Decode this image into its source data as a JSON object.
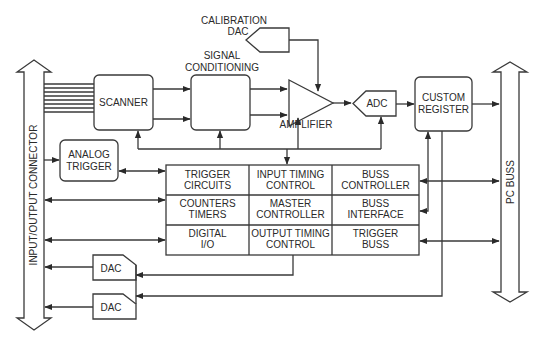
{
  "diagram": {
    "type": "block-diagram",
    "connectors": {
      "left": "INPUT/OUTPUT CONNECTOR",
      "right": "PC BUSS"
    },
    "blocks": {
      "calibration_dac": [
        "CALIBRATION",
        "DAC"
      ],
      "signal_conditioning_title": [
        "SIGNAL",
        "CONDITIONING"
      ],
      "scanner": "SCANNER",
      "amplifier": "AMPLIFIER",
      "adc": "ADC",
      "custom_register": [
        "CUSTOM",
        "REGISTER"
      ],
      "analog_trigger": [
        "ANALOG",
        "TRIGGER"
      ],
      "dac1": "DAC",
      "dac2": "DAC"
    },
    "grid": [
      [
        [
          "TRIGGER",
          "CIRCUITS"
        ],
        [
          "INPUT TIMING",
          "CONTROL"
        ],
        [
          "BUSS",
          "CONTROLLER"
        ]
      ],
      [
        [
          "COUNTERS",
          "TIMERS"
        ],
        [
          "MASTER",
          "CONTROLLER"
        ],
        [
          "BUSS",
          "INTERFACE"
        ]
      ],
      [
        [
          "DIGITAL",
          "I/O"
        ],
        [
          "OUTPUT TIMING",
          "CONTROL"
        ],
        [
          "TRIGGER",
          "BUSS"
        ]
      ]
    ],
    "colors": {
      "line": "#3a3a3a",
      "text": "#2a2a2a",
      "background": "#ffffff"
    }
  }
}
